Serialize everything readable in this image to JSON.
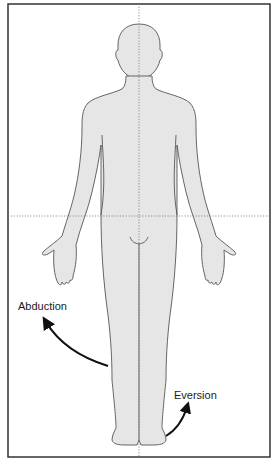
{
  "figure": {
    "colors": {
      "body_fill": "#e6e6e6",
      "outline": "#555555",
      "frame": "#333333",
      "axis_lines": "#777777",
      "arrow": "#111111",
      "background": "#ffffff"
    },
    "axes": {
      "vertical": "midline (dotted)",
      "horizontal": "transverse line at hip level (dotted)"
    }
  },
  "labels": {
    "abduction": "Abduction",
    "eversion": "Eversion"
  }
}
